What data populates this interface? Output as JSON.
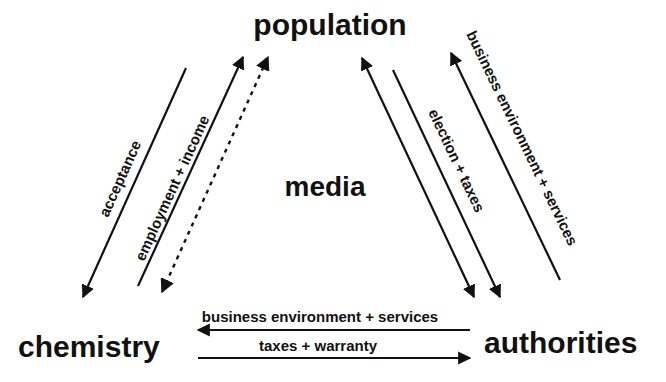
{
  "nodes": {
    "population": "population",
    "media": "media",
    "chemistry": "chemistry",
    "authorities": "authorities"
  },
  "edges": {
    "acceptance": "acceptance",
    "employment_income": "employment + income",
    "election_taxes": "election + taxes",
    "business_services_right": "business environment + services",
    "business_services_bottom": "business environment + services",
    "taxes_warranty": "taxes + warranty"
  },
  "colors": {
    "ink": "#111111",
    "background": "#ffffff"
  }
}
